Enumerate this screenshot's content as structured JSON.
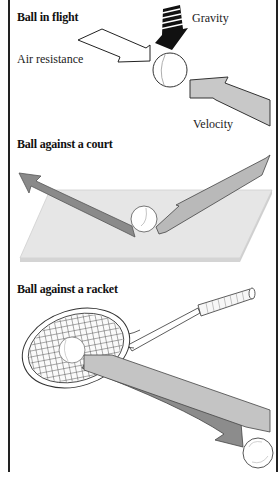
{
  "panels": [
    {
      "title": "Ball in flight",
      "labels": {
        "gravity": "Gravity",
        "air_resistance": "Air resistance",
        "velocity": "Velocity"
      }
    },
    {
      "title": "Ball against a court"
    },
    {
      "title": "Ball against a racket"
    }
  ],
  "colors": {
    "frame": "#222222",
    "gravity_arrow": "#111111",
    "air_arrow": "#ffffff",
    "velocity_arrow": "#c8c8c8",
    "outgoing_arrow": "#8a8a8a",
    "incoming_arrow": "#b9b9b9",
    "court": "#e4e4e4",
    "racket_arrow_light": "#c4c4c4",
    "racket_arrow_dark": "#8c8c8c"
  }
}
